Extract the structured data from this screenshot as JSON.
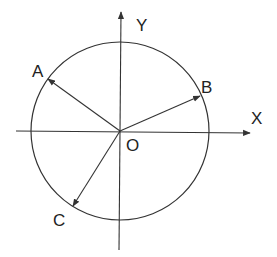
{
  "diagram": {
    "colors": {
      "stroke": "#333333",
      "text": "#222222",
      "background": "#ffffff"
    },
    "origin": {
      "label": "O",
      "x": 120,
      "y": 131
    },
    "circle": {
      "cx": 120,
      "cy": 131,
      "r": 89
    },
    "axes": {
      "x": {
        "label": "X",
        "x1": 16,
        "y1": 131,
        "x2": 250,
        "y2": 133
      },
      "y": {
        "label": "Y",
        "x1": 119,
        "y1": 250,
        "x2": 121,
        "y2": 12
      }
    },
    "vectors": [
      {
        "label": "A",
        "tip_x": 48,
        "tip_y": 79
      },
      {
        "label": "B",
        "tip_x": 200,
        "tip_y": 96
      },
      {
        "label": "C",
        "tip_x": 73,
        "tip_y": 206
      }
    ]
  }
}
